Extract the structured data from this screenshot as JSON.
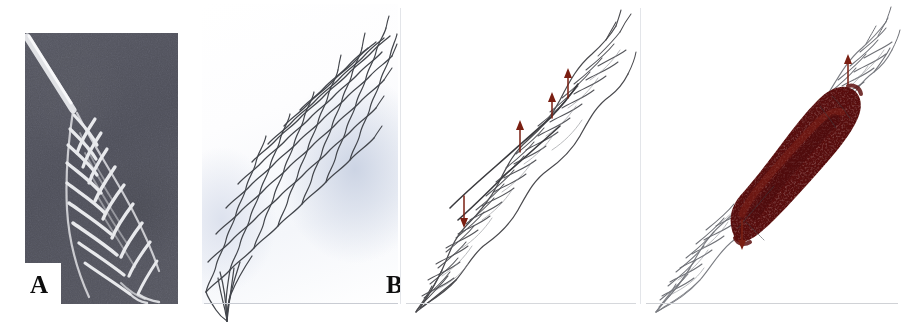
{
  "figure": {
    "type": "multi-panel-medical-figure",
    "width": 909,
    "height": 324,
    "background_color": "#ffffff",
    "panel_count": 4
  },
  "panels": [
    {
      "id": "A",
      "label": "A",
      "kind": "photograph",
      "description": "Grayscale photograph of a braided wire stent partially deployed from a delivery catheter against a dark gray background",
      "background_color": "#52535d",
      "wire_color": "#e8e9ec",
      "has_notch": true
    },
    {
      "id": "B",
      "label": "B",
      "kind": "line-drawing",
      "description": "Line drawing of the fully expanded braided stent mesh showing the diamond cell pattern, tapering to a point at the distal tip",
      "background_gradient_from": "#ffffff",
      "background_gradient_to": "#ccd4e4",
      "wire_color": "#3f4248"
    },
    {
      "id": "C",
      "label": "C",
      "kind": "line-drawing",
      "description": "Line drawing of the stent in a constrained / twisted state with dark red radiopaque marker arrows along the longitudinal wire",
      "background_color": "#ffffff",
      "wire_color": "#4a4a4e",
      "marker_color": "#7a1f12",
      "marker_count": 4
    },
    {
      "id": "D",
      "label": "D",
      "kind": "line-drawing",
      "description": "Line drawing of the same stent with the mid-body covered by a dark red graft membrane between the proximal and distal markers",
      "background_color": "#ffffff",
      "wire_color": "#6e7076",
      "graft_color": "#5e1210",
      "graft_highlight_color": "#7d2118",
      "marker_color": "#7a1f12"
    }
  ],
  "colors": {
    "photo_background": "#52535d",
    "photo_wire": "#e8e9ec",
    "drawing_wire": "#3f4248",
    "marker_red": "#7a1f12",
    "graft_maroon": "#5e1210",
    "page_background": "#ffffff",
    "label_text": "#0d0d0d",
    "rule_gray": "#d0d2d6"
  },
  "labels": {
    "a": "A",
    "b": "B",
    "c": "C",
    "d": "D"
  }
}
